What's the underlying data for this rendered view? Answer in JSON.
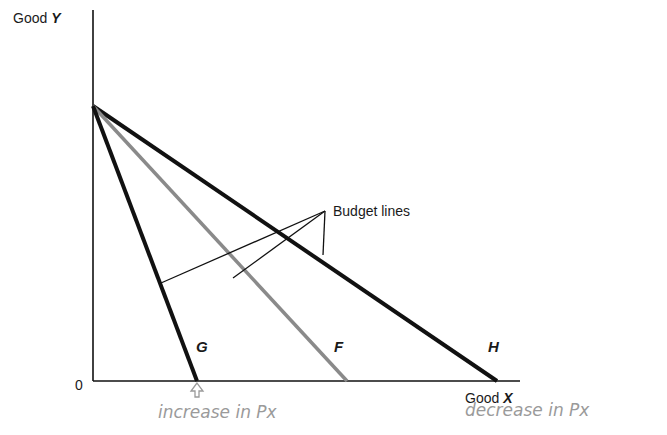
{
  "diagram": {
    "axes": {
      "y_label_prefix": "Good ",
      "y_label_var": "Y",
      "x_label_prefix": "Good ",
      "x_label_var": "X",
      "origin": "0"
    },
    "callout": "Budget lines",
    "lines": [
      {
        "id": "G",
        "label": "G",
        "color": "#111111"
      },
      {
        "id": "F",
        "label": "F",
        "color": "#8a8a8a"
      },
      {
        "id": "H",
        "label": "H",
        "color": "#111111"
      }
    ],
    "annotations": {
      "increase": "increase in Px",
      "decrease": "decrease in Px"
    }
  }
}
